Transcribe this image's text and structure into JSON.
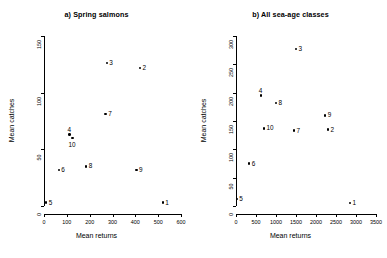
{
  "figure": {
    "width": 387,
    "height": 258,
    "background": "#ffffff",
    "foreground": "#000000"
  },
  "chart_data": [
    {
      "type": "scatter",
      "title": "a) Spring salmons",
      "xlabel": "Mean returns",
      "ylabel": "Mean catches",
      "xlim": [
        0,
        600
      ],
      "ylim": [
        0,
        150
      ],
      "xticks": [
        0,
        100,
        200,
        300,
        400,
        500,
        600
      ],
      "yticks": [
        0,
        50,
        100,
        150
      ],
      "grid": false,
      "legend": "none",
      "point_labels_position": "right-of-marker",
      "points": [
        {
          "label": "1",
          "x": 520,
          "y": 3,
          "label_side": "right"
        },
        {
          "label": "2",
          "x": 420,
          "y": 122,
          "label_side": "right"
        },
        {
          "label": "3",
          "x": 275,
          "y": 126,
          "label_side": "right"
        },
        {
          "label": "4",
          "x": 112,
          "y": 63,
          "label_side": "above"
        },
        {
          "label": "5",
          "x": 10,
          "y": 3,
          "label_side": "right"
        },
        {
          "label": "6",
          "x": 65,
          "y": 32,
          "label_side": "right"
        },
        {
          "label": "7",
          "x": 270,
          "y": 81,
          "label_side": "right"
        },
        {
          "label": "8",
          "x": 185,
          "y": 35,
          "label_side": "right"
        },
        {
          "label": "9",
          "x": 405,
          "y": 32,
          "label_side": "right"
        },
        {
          "label": "10",
          "x": 125,
          "y": 60,
          "label_side": "below"
        }
      ]
    },
    {
      "type": "scatter",
      "title": "b) All sea-age classes",
      "xlabel": "Mean returns",
      "ylabel": "Mean catches",
      "xlim": [
        0,
        3500
      ],
      "ylim": [
        0,
        300
      ],
      "xticks": [
        0,
        500,
        1000,
        1500,
        2000,
        2500,
        3000,
        3500
      ],
      "yticks": [
        0,
        50,
        100,
        150,
        200,
        250,
        300
      ],
      "grid": false,
      "legend": "none",
      "point_labels_position": "right-of-marker",
      "points": [
        {
          "label": "1",
          "x": 2850,
          "y": 5,
          "label_side": "right"
        },
        {
          "label": "2",
          "x": 2300,
          "y": 135,
          "label_side": "right"
        },
        {
          "label": "3",
          "x": 1500,
          "y": 277,
          "label_side": "right"
        },
        {
          "label": "4",
          "x": 620,
          "y": 195,
          "label_side": "above"
        },
        {
          "label": "5",
          "x": 20,
          "y": 12,
          "label_side": "right"
        },
        {
          "label": "6",
          "x": 330,
          "y": 75,
          "label_side": "right"
        },
        {
          "label": "7",
          "x": 1450,
          "y": 133,
          "label_side": "right"
        },
        {
          "label": "8",
          "x": 1000,
          "y": 182,
          "label_side": "right"
        },
        {
          "label": "9",
          "x": 2230,
          "y": 160,
          "label_side": "right"
        },
        {
          "label": "10",
          "x": 700,
          "y": 137,
          "label_side": "right"
        }
      ]
    }
  ]
}
